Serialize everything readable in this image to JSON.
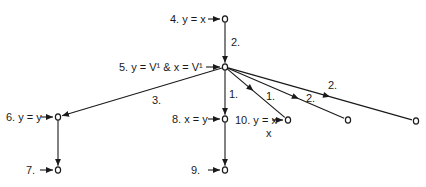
{
  "diagram": {
    "type": "tree",
    "colors": {
      "ink": "#1a1a1a",
      "background": "#ffffff"
    },
    "nodes": [
      {
        "id": "n4",
        "x": 225,
        "y": 19,
        "label": "4. y = x"
      },
      {
        "id": "n5",
        "x": 225,
        "y": 67,
        "label": "5. y = V¹ & x = V¹"
      },
      {
        "id": "n6",
        "x": 58,
        "y": 117,
        "label": "6. y = y"
      },
      {
        "id": "n7",
        "x": 58,
        "y": 170,
        "label": "7."
      },
      {
        "id": "n8",
        "x": 225,
        "y": 119,
        "label": "8. x = y"
      },
      {
        "id": "n9",
        "x": 225,
        "y": 170,
        "label": "9."
      },
      {
        "id": "n10",
        "x": 288,
        "y": 120,
        "label": "10. y = x",
        "sublabel": "x"
      },
      {
        "id": "n11",
        "x": 348,
        "y": 120,
        "label": ""
      },
      {
        "id": "n12",
        "x": 416,
        "y": 121,
        "label": ""
      }
    ],
    "edges": [
      {
        "from": "n4",
        "to": "n5",
        "label": "2."
      },
      {
        "from": "n5",
        "to": "n6",
        "label": "3."
      },
      {
        "from": "n5",
        "to": "n8",
        "label": "1."
      },
      {
        "from": "n5",
        "to": "n10",
        "label": "1."
      },
      {
        "from": "n5",
        "to": "n11",
        "label": "2."
      },
      {
        "from": "n5",
        "to": "n12",
        "label": "2."
      },
      {
        "from": "n6",
        "to": "n7",
        "label": ""
      },
      {
        "from": "n8",
        "to": "n9",
        "label": ""
      }
    ],
    "node_symbol": "o",
    "pointer_symbol": "→"
  }
}
